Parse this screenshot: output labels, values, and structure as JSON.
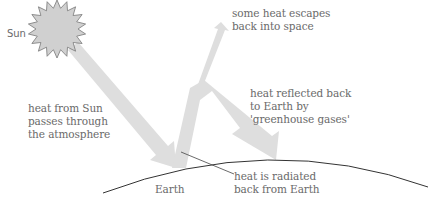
{
  "diagram": {
    "colors": {
      "arrow": "#dedede",
      "sun_fill": "#d0d0d0",
      "sun_stroke": "#777777",
      "earth_line": "#333333",
      "text": "#6a6a6a",
      "leader": "#444444"
    },
    "labels": {
      "sun": "Sun",
      "escape": "some heat escapes\nback into space",
      "incoming": "heat from Sun\npasses through\nthe atmosphere",
      "reflected": "heat reflected back\nto Earth by\n'greenhouse gases'",
      "earth": "Earth",
      "radiated": "heat is radiated\nback from Earth"
    }
  }
}
